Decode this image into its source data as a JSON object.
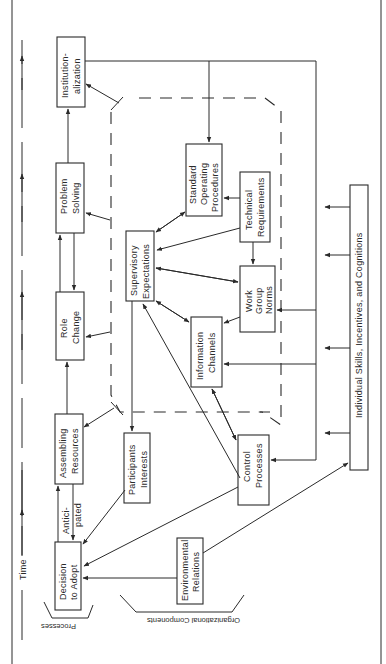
{
  "diagram": {
    "time_label": "Time",
    "group_labels": {
      "processes": "Processes",
      "organizational_components": "Organizational Components"
    },
    "processes": [
      {
        "id": "decision",
        "lines": [
          "Decision",
          "to Adopt"
        ]
      },
      {
        "id": "assembling",
        "lines": [
          "Assembling",
          "Resources"
        ]
      },
      {
        "id": "role",
        "lines": [
          "Role",
          "Change"
        ]
      },
      {
        "id": "problem",
        "lines": [
          "Problem",
          "Solving"
        ]
      },
      {
        "id": "institution",
        "lines": [
          "Institution-",
          "alization"
        ]
      }
    ],
    "edge_label_anticipated": [
      "Antici-",
      "pated"
    ],
    "components": [
      {
        "id": "participants",
        "lines": [
          "Participants",
          "Interests"
        ]
      },
      {
        "id": "supervisory",
        "lines": [
          "Supervisory",
          "Expectations"
        ]
      },
      {
        "id": "sop",
        "lines": [
          "Standard",
          "Operating",
          "Procedures"
        ]
      },
      {
        "id": "technical",
        "lines": [
          "Technical",
          "Requirements"
        ]
      },
      {
        "id": "workgroup",
        "lines": [
          "Work",
          "Group",
          "Norms"
        ]
      },
      {
        "id": "information",
        "lines": [
          "Information",
          "Channels"
        ]
      },
      {
        "id": "control",
        "lines": [
          "Control",
          "Processes"
        ]
      },
      {
        "id": "environmental",
        "lines": [
          "Environmental",
          "Relations"
        ]
      },
      {
        "id": "individual",
        "lines": [
          "Individual Skills, Incentives, and Cognitions"
        ]
      }
    ]
  }
}
